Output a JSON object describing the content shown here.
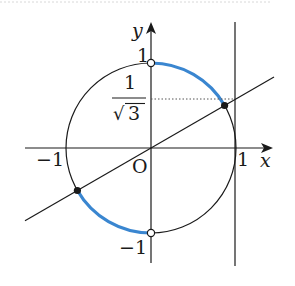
{
  "diagram": {
    "type": "unit-circle",
    "colors": {
      "ink": "#1a1a1a",
      "arc_highlight": "#3a86d0",
      "open_point_fill": "#ffffff",
      "dotted": "#555555"
    },
    "axes": {
      "x_label": "x",
      "y_label": "y",
      "origin_label": "O"
    },
    "tick_labels": {
      "x_neg_one": "−1",
      "x_pos_one": "1",
      "y_pos_one": "1",
      "y_neg_one": "−1"
    },
    "fraction_label": {
      "numerator": "1",
      "denominator": "3",
      "radical": "√",
      "value_text": "1/√3"
    },
    "elements": {
      "circle": "unit circle x²+y²=1",
      "line": "y = x/√3 through origin",
      "vertical_line": "x = 1",
      "highlighted_arcs": [
        "from (0,1) to (√3/2, 1/2)",
        "from (−√3/2, −1/2) to (0,−1)"
      ],
      "filled_points": [
        "(√3/2, 1/2)",
        "(−√3/2, −1/2)"
      ],
      "open_points": [
        "(0, 1)",
        "(0, −1)"
      ]
    }
  }
}
